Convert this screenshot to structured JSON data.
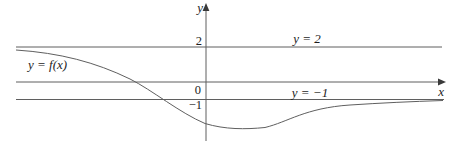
{
  "figure": {
    "background": "#ffffff",
    "stroke_color": "#5f5f5f",
    "text_color": "#1d1d1d",
    "labels": {
      "y_axis": "y",
      "x_axis": "x",
      "tick_top": "2",
      "tick_origin": "0",
      "tick_bottom": "−1",
      "asymptote_top": "y = 2",
      "asymptote_bottom": "y = −1",
      "curve": "y = f(x)"
    }
  },
  "chart_data": {
    "type": "line",
    "title": "",
    "xlabel": "x",
    "ylabel": "y",
    "grid": false,
    "legend": "none",
    "y_ticks": [
      2,
      0,
      -1
    ],
    "x_ticks": [],
    "ylim": [
      -3.3,
      4.4
    ],
    "horizontal_asymptotes": [
      {
        "y": 2,
        "label": "y = 2",
        "approached_as": "x → −∞"
      },
      {
        "y": -1,
        "label": "y = −1",
        "approached_as": "x → +∞"
      }
    ],
    "series": [
      {
        "name": "y = f(x)",
        "x": [
          -10.9,
          -8.3,
          -6.1,
          -4.1,
          -2.6,
          -1.5,
          -0.1,
          1.7,
          3.4,
          5.4,
          8.2,
          11.1,
          13.5
        ],
        "y": [
          1.8,
          1.6,
          0.8,
          0.0,
          -1.0,
          -1.7,
          -2.4,
          -2.7,
          -2.6,
          -1.9,
          -1.3,
          -1.1,
          -1.1
        ]
      }
    ],
    "x_axis_note": "no x tick labels shown; x values estimated in y-axis units"
  },
  "geometry": {
    "width": 462,
    "height": 146,
    "origin_px": {
      "x": 206,
      "y": 82
    },
    "px_per_unit": 17.5,
    "x_axis": {
      "x1": 16,
      "y": 82,
      "x2": 439
    },
    "x_arrow_points": "446,82 438,78.6 438,85.4",
    "y_axis": {
      "x": 206,
      "y1": 10,
      "y2": 141
    },
    "y_arrow_points": "206,3 202.6,11 209.4,11",
    "line_y2": {
      "x1": 16,
      "y": 47,
      "x2": 442
    },
    "line_yneg1": {
      "x1": 16,
      "y": 99.5,
      "x2": 444
    },
    "curve_path": "M 16 50 C 60 53, 95 62, 130 79 C 152 90, 180 113, 205 123.5 C 225 129.5, 245 129.5, 265 127.5 C 288 122, 305 108, 350 105 C 380 103, 412 101.5, 443 100.5"
  }
}
